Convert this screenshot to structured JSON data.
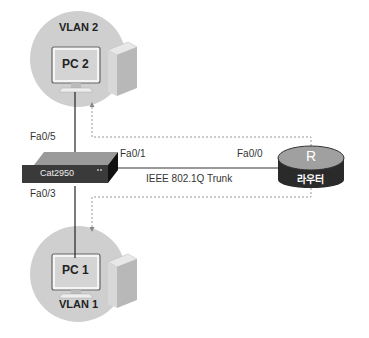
{
  "diagram": {
    "colors": {
      "background": "#ffffff",
      "pc_circle": "#cfcfcf",
      "link": "#222222",
      "trunk": "#777777",
      "dotted": "#999999",
      "switch_front": "#3a3a3a",
      "switch_top": "#9a9a9a",
      "router_top": "#a0a0a0",
      "router_side": "#2a2a2a"
    },
    "nodes": {
      "pc2": {
        "vlan": "VLAN 2",
        "name": "PC 2",
        "icon": "desktop-computer-icon"
      },
      "pc1": {
        "vlan": "VLAN 1",
        "name": "PC 1",
        "icon": "desktop-computer-icon"
      },
      "switch": {
        "name": "Cat2950",
        "icon": "switch-icon"
      },
      "router": {
        "symbol": "R",
        "name": "라우터",
        "icon": "router-icon"
      }
    },
    "ports": {
      "switch_to_pc2": "Fa0/5",
      "switch_to_pc1": "Fa0/3",
      "switch_to_router": "Fa0/1",
      "router_to_switch": "Fa0/0"
    },
    "links": {
      "trunk_label": "IEEE 802.1Q Trunk"
    }
  }
}
